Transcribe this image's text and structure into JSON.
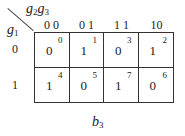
{
  "kmap": {
    "col_var": "g",
    "col_var_sub1": "2",
    "col_var2": "g",
    "col_var_sub2": "3",
    "row_var": "g",
    "row_var_sub": "1",
    "col_headers": [
      "0 0",
      "0 1",
      "1 1",
      "10"
    ],
    "row_headers": [
      "0",
      "1"
    ],
    "rows": [
      [
        {
          "value": "0",
          "index": "0"
        },
        {
          "value": "1",
          "index": "1"
        },
        {
          "value": "0",
          "index": "3"
        },
        {
          "value": "1",
          "index": "2"
        }
      ],
      [
        {
          "value": "1",
          "index": "4"
        },
        {
          "value": "0",
          "index": "5"
        },
        {
          "value": "1",
          "index": "7"
        },
        {
          "value": "0",
          "index": "6"
        }
      ]
    ],
    "caption": "b",
    "caption_sub": "3"
  }
}
